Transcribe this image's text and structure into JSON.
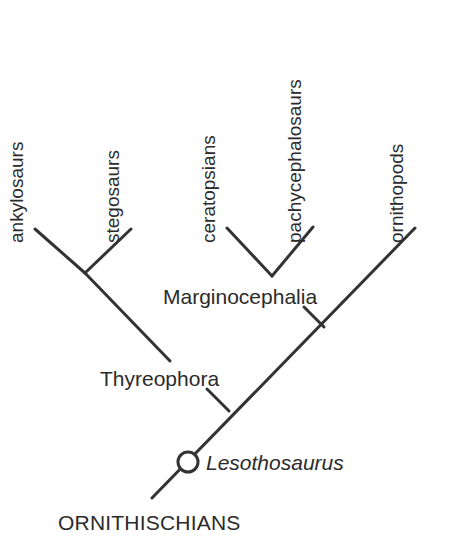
{
  "diagram": {
    "line_color": "#333333",
    "text_color": "#2b2b2b",
    "background": "#ffffff",
    "node_fill": "#ffffff",
    "node_stroke": "#333333"
  },
  "tips": [
    {
      "id": "ankylosaurs",
      "label": "ankylosaurs"
    },
    {
      "id": "stegosaurs",
      "label": "stegosaurs"
    },
    {
      "id": "ceratopsians",
      "label": "ceratopsians"
    },
    {
      "id": "pachycephalosaurs",
      "label": "pachycephalosaurs"
    },
    {
      "id": "ornithopods",
      "label": "ornithopods"
    }
  ],
  "clades": [
    {
      "id": "marginocephalia",
      "label": "Marginocephalia"
    },
    {
      "id": "thyreophora",
      "label": "Thyreophora"
    }
  ],
  "species": [
    {
      "id": "lesothosaurus",
      "label": "Lesothosaurus",
      "style": "italic",
      "node": "open-circle"
    }
  ],
  "root": {
    "label": "ORNITHISCHIANS"
  }
}
